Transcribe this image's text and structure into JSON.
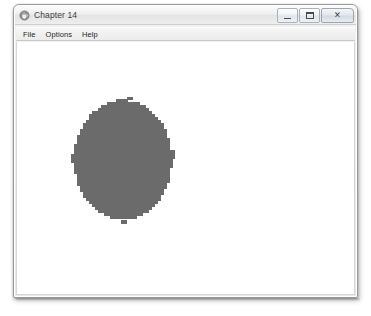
{
  "window": {
    "title": "Chapter 14",
    "icon": "java-coffee-cup-icon",
    "controls": {
      "minimize_label": "—",
      "maximize_label": "□",
      "close_label": "✕",
      "minimize_name": "minimize",
      "maximize_name": "maximize",
      "close_name": "close"
    }
  },
  "menu": {
    "items": [
      {
        "label": "File"
      },
      {
        "label": "Options"
      },
      {
        "label": "Help"
      }
    ]
  },
  "canvas": {
    "background_color": "#ffffff",
    "shape": {
      "type": "ellipse",
      "fill_color": "#6b6b6b",
      "rendering": "aliased-pixelated",
      "bounds": {
        "x": 57,
        "y": 57,
        "width": 98,
        "height": 121
      },
      "center": {
        "cx": 106,
        "cy": 118
      },
      "radius_x": 49,
      "radius_y": 60,
      "pixel_block_size": 3
    }
  }
}
